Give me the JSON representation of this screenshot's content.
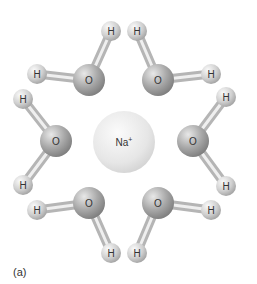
{
  "figure": {
    "caption": "(a)",
    "ion": {
      "label": "Na",
      "charge": "+",
      "x": 124,
      "y": 142,
      "r": 31
    },
    "molecules": [
      {
        "o": {
          "label": "O",
          "x": 89,
          "y": 80
        },
        "h": [
          {
            "label": "H",
            "x": 111,
            "y": 31
          },
          {
            "label": "H",
            "x": 37,
            "y": 74
          }
        ]
      },
      {
        "o": {
          "label": "O",
          "x": 158,
          "y": 80
        },
        "h": [
          {
            "label": "H",
            "x": 137,
            "y": 31
          },
          {
            "label": "H",
            "x": 211,
            "y": 74
          }
        ]
      },
      {
        "o": {
          "label": "O",
          "x": 56,
          "y": 141
        },
        "h": [
          {
            "label": "H",
            "x": 23,
            "y": 99
          },
          {
            "label": "H",
            "x": 23,
            "y": 185
          }
        ]
      },
      {
        "o": {
          "label": "O",
          "x": 193,
          "y": 141
        },
        "h": [
          {
            "label": "H",
            "x": 226,
            "y": 97
          },
          {
            "label": "H",
            "x": 226,
            "y": 186
          }
        ]
      },
      {
        "o": {
          "label": "O",
          "x": 89,
          "y": 203
        },
        "h": [
          {
            "label": "H",
            "x": 37,
            "y": 210
          },
          {
            "label": "H",
            "x": 111,
            "y": 253
          }
        ]
      },
      {
        "o": {
          "label": "O",
          "x": 158,
          "y": 203
        },
        "h": [
          {
            "label": "H",
            "x": 211,
            "y": 210
          },
          {
            "label": "H",
            "x": 137,
            "y": 253
          }
        ]
      }
    ]
  }
}
